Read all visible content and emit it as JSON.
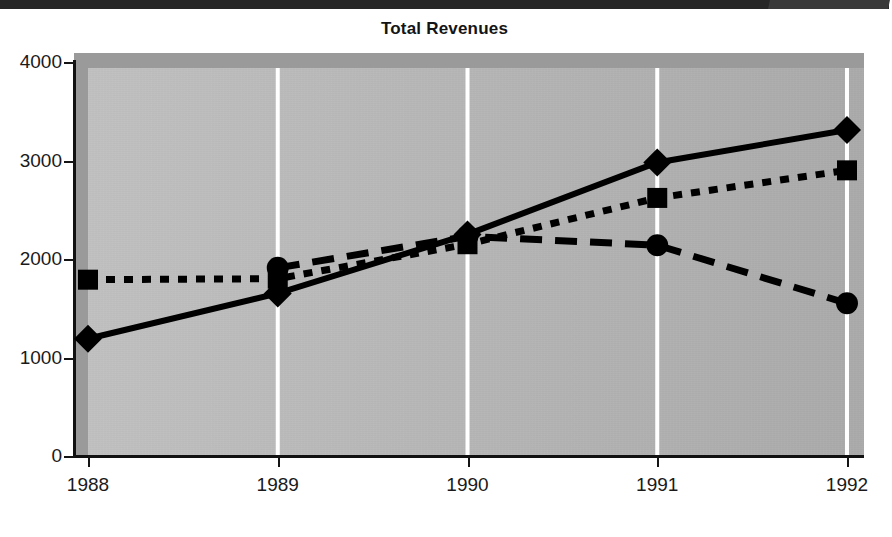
{
  "chart_data": {
    "type": "line",
    "title": "Total Revenues",
    "xlabel": "",
    "ylabel": "",
    "categories": [
      "1988",
      "1989",
      "1990",
      "1991",
      "1992"
    ],
    "x": [
      1988,
      1989,
      1990,
      1991,
      1992
    ],
    "xlim": [
      1988,
      1992
    ],
    "ylim": [
      0,
      4000
    ],
    "ytick_labels": [
      "0",
      "1000",
      "2000",
      "3000",
      "4000"
    ],
    "yticks": [
      0,
      1000,
      2000,
      3000,
      4000
    ],
    "grid": "vertical-white-gridlines",
    "legend": "none",
    "series": [
      {
        "name": "series-diamond",
        "marker": "diamond",
        "line_style": "solid",
        "color": "#000000",
        "values": [
          1190,
          1650,
          2250,
          2980,
          3310
        ]
      },
      {
        "name": "series-square",
        "marker": "square",
        "line_style": "dotted",
        "color": "#000000",
        "values": [
          1790,
          1800,
          2150,
          2620,
          2900
        ]
      },
      {
        "name": "series-circle",
        "marker": "circle",
        "line_style": "dashed",
        "color": "#000000",
        "values": [
          null,
          1910,
          2230,
          2140,
          1550
        ]
      }
    ],
    "colors": {
      "plot_background": "#b9b9b9",
      "plot_shadow_band": "#9a9a9a",
      "gridline": "#ffffff",
      "axis": "#111111",
      "data": "#000000",
      "page_background": "#ffffff"
    }
  }
}
